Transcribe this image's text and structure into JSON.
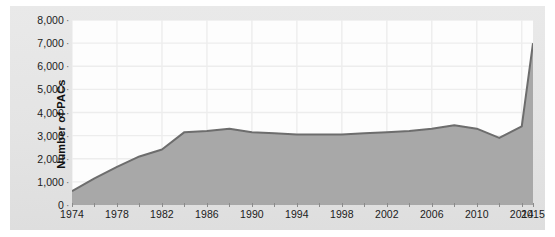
{
  "chart_data": {
    "type": "area",
    "title": "",
    "xlabel": "",
    "ylabel": "Number of PACs",
    "ylim": [
      0,
      8000
    ],
    "xlim": [
      1974,
      2015
    ],
    "grid": true,
    "legend": "none",
    "y_ticks": [
      "0",
      "1,000",
      "2,000",
      "3,000",
      "4,000",
      "5,000",
      "6,000",
      "7,000",
      "8,000"
    ],
    "y_tick_values": [
      0,
      1000,
      2000,
      3000,
      4000,
      5000,
      6000,
      7000,
      8000
    ],
    "x_tick_labels": [
      "1974",
      "1978",
      "1982",
      "1986",
      "1990",
      "1994",
      "1998",
      "2002",
      "2006",
      "2010",
      "2014",
      "2015"
    ],
    "x_tick_values": [
      1974,
      1978,
      1982,
      1986,
      1990,
      1994,
      1998,
      2002,
      2006,
      2010,
      2014,
      2015
    ],
    "x_minor_ticks": [
      1974,
      1976,
      1978,
      1980,
      1982,
      1984,
      1986,
      1988,
      1990,
      1992,
      1994,
      1996,
      1998,
      2000,
      2002,
      2004,
      2006,
      2008,
      2010,
      2012,
      2014,
      2015
    ],
    "series": [
      {
        "name": "Number of PACs",
        "x": [
          1974,
          1976,
          1978,
          1980,
          1982,
          1984,
          1986,
          1988,
          1990,
          1992,
          1994,
          1996,
          1998,
          2000,
          2002,
          2004,
          2006,
          2008,
          2010,
          2012,
          2014,
          2015
        ],
        "values": [
          600,
          1150,
          1650,
          2100,
          2400,
          3150,
          3200,
          3300,
          3150,
          3100,
          3050,
          3050,
          3050,
          3100,
          3150,
          3200,
          3300,
          3450,
          3300,
          2900,
          3400,
          7000
        ]
      }
    ],
    "colors": {
      "area_fill": "#a8a8a8",
      "line": "#6d6d6d",
      "plot_background": "#fdfdfd",
      "panel_background": "#e5e5e5",
      "gridline": "#ededed",
      "text": "#1b1b1b"
    }
  }
}
